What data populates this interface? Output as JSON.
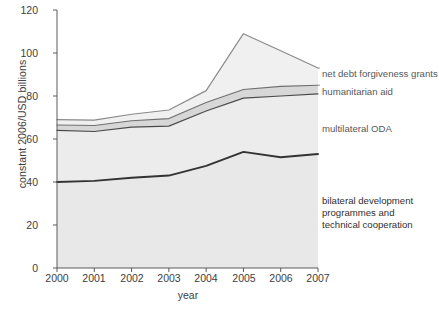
{
  "chart_data": {
    "type": "area",
    "title": "",
    "subtitle": "",
    "xlabel": "year",
    "ylabel": "constant 2006/USD billions",
    "categories": [
      "2000",
      "2001",
      "2002",
      "2003",
      "2004",
      "2005",
      "2006",
      "2007"
    ],
    "x": [
      2000,
      2001,
      2002,
      2003,
      2004,
      2005,
      2006,
      2007
    ],
    "xlim": [
      2000,
      2007
    ],
    "ylim": [
      0,
      120
    ],
    "yticks": [
      0,
      20,
      40,
      60,
      80,
      100,
      120
    ],
    "xticks": [
      2000,
      2001,
      2002,
      2003,
      2004,
      2005,
      2006,
      2007
    ],
    "grid": false,
    "stacked": true,
    "legend_position": "right-inline-annotations",
    "series": [
      {
        "name": "bilateral development programmes and technical cooperation",
        "values": [
          40,
          40.5,
          42,
          43,
          47.5,
          54,
          51.5,
          53
        ],
        "color": "#e8e8e8",
        "line_color": "#333333"
      },
      {
        "name": "multilateral ODA",
        "values": [
          24,
          23,
          23.5,
          23,
          25.5,
          25,
          28.5,
          28
        ],
        "color": "#ececec",
        "line_color": "#4a4a4a"
      },
      {
        "name": "humanitarian aid",
        "values": [
          2.5,
          2.8,
          3.0,
          3.5,
          4.0,
          4.0,
          4.5,
          4.0
        ],
        "color": "#d7d7d7",
        "line_color": "#6f6f6f"
      },
      {
        "name": "net debt forgiveness grants",
        "values": [
          2.5,
          2.5,
          3.0,
          4.0,
          5.5,
          26.0,
          16.5,
          8.0
        ],
        "color": "#f0f0f0",
        "line_color": "#8a8a8a"
      }
    ],
    "cumulative_boundaries": {
      "bilateral_development": [
        40,
        40.5,
        42,
        43,
        47.5,
        54,
        51.5,
        53
      ],
      "multilateral_oda_top": [
        64,
        63.5,
        65.5,
        66,
        73,
        79,
        80,
        81
      ],
      "humanitarian_aid_top": [
        66.5,
        66.3,
        68.5,
        69.5,
        77,
        83,
        84.5,
        85
      ],
      "net_debt_forgiveness_top": [
        69,
        68.8,
        71.5,
        73.5,
        82.5,
        109,
        101,
        93
      ]
    },
    "annotations": [
      {
        "id": "net-debt-forgiveness-grants",
        "text": "net debt forgiveness grants"
      },
      {
        "id": "humanitarian-aid",
        "text": "humanitarian aid"
      },
      {
        "id": "multilateral-oda",
        "text": "multilateral ODA"
      },
      {
        "id": "bilateral-development",
        "text": "bilateral development\nprogrammes and\ntechnical cooperation"
      }
    ]
  },
  "axis": {
    "y_title": "constant 2006/USD billions",
    "x_title": "year",
    "y_tick_labels": [
      "120",
      "100",
      "80",
      "60",
      "40",
      "20",
      "0"
    ],
    "x_tick_labels": [
      "2000",
      "2001",
      "2002",
      "2003",
      "2004",
      "2005",
      "2006",
      "2007"
    ]
  },
  "annotations": {
    "net_debt": "net debt forgiveness grants",
    "humanitarian": "humanitarian aid",
    "multilateral": "multilateral ODA",
    "bilateral_line1": "bilateral development",
    "bilateral_line2": "programmes and",
    "bilateral_line3": "technical cooperation"
  },
  "colors": {
    "axis": "#5a5a5a",
    "text": "#3d3d3d",
    "anno_text": "#55585a",
    "band_bilateral": "#e8e8e8",
    "band_multilateral": "#ececec",
    "band_humanitarian": "#d7d7d7",
    "band_netdebt": "#f0f0f0",
    "line_bilateral": "#333333",
    "line_multilateral": "#4a4a4a",
    "line_humanitarian": "#6f6f6f",
    "line_netdebt": "#8a8a8a"
  }
}
